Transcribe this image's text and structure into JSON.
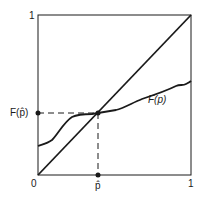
{
  "diagram": {
    "type": "fixed-point-plot",
    "axes": {
      "x_min_label": "0",
      "x_max_label": "1",
      "y_min_label": "0",
      "y_max_label": "1",
      "x_marker_label": "p̂",
      "y_marker_label": "F(p̂)"
    },
    "curves": {
      "diagonal_label": "",
      "function_label": "F(p)"
    },
    "fixed_point": {
      "x_label": "p̂",
      "y_label": "F(p̂)"
    },
    "colors": {
      "ink": "#1a1a1a",
      "background": "#ffffff"
    }
  }
}
